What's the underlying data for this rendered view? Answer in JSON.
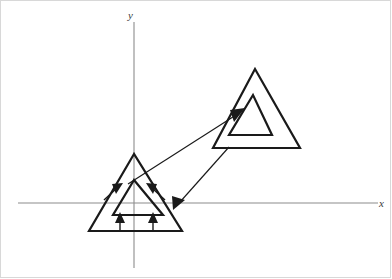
{
  "figure": {
    "background_color": "#ffffff",
    "width": 392,
    "height": 279
  },
  "axes": {
    "x_axis": {
      "label": "x",
      "color": "#8c8c8c",
      "y_position": 203,
      "x_start": 18,
      "x_end": 378,
      "label_position": {
        "x": 379,
        "y": 198
      }
    },
    "y_axis": {
      "label": "y",
      "color": "#8c8c8c",
      "x_position": 134,
      "y_start": 22,
      "y_end": 268,
      "label_position": {
        "x": 128,
        "y": 10
      }
    }
  },
  "shapes": {
    "stroke_color": "#1a1a1a",
    "items": [
      {
        "name": "left-outer-triangle",
        "points": "134,154 89,231 182,231",
        "stroke_width": 2.2
      },
      {
        "name": "left-inner-triangle",
        "points": "134,180 113,215 163,215",
        "stroke_width": 2.2
      },
      {
        "name": "right-outer-triangle",
        "points": "255,69 213,148 300,148",
        "stroke_width": 2.2
      },
      {
        "name": "right-inner-triangle",
        "points": "253,95 229,135 272,135",
        "stroke_width": 2.2
      }
    ]
  },
  "arrows": {
    "mapping_arrows": [
      {
        "name": "forward-mapping-arrow",
        "description": "from left inner triangle apex toward right inner triangle left edge",
        "from": {
          "x": 134,
          "y": 180
        },
        "to": {
          "x": 244,
          "y": 110
        }
      },
      {
        "name": "reverse-mapping-arrow",
        "description": "from right outer triangle bottom-left corner toward left outer triangle right edge",
        "from": {
          "x": 228,
          "y": 148
        },
        "to": {
          "x": 174,
          "y": 209
        }
      }
    ],
    "scale_arrows": [
      {
        "name": "scale-arrow-left-side",
        "from": {
          "x": 106,
          "y": 198
        },
        "to": {
          "x": 122,
          "y": 183
        }
      },
      {
        "name": "scale-arrow-right-side",
        "from": {
          "x": 163,
          "y": 198
        },
        "to": {
          "x": 148,
          "y": 183
        }
      },
      {
        "name": "scale-arrow-bottom-left",
        "from": {
          "x": 120,
          "y": 228
        },
        "to": {
          "x": 120,
          "y": 212
        }
      },
      {
        "name": "scale-arrow-bottom-right",
        "from": {
          "x": 153,
          "y": 228
        },
        "to": {
          "x": 153,
          "y": 212
        }
      }
    ]
  }
}
